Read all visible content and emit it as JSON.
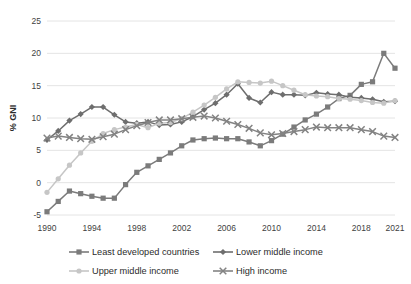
{
  "chart_data": {
    "type": "line",
    "title": "",
    "xlabel": "",
    "ylabel": "% GNI",
    "ylim": [
      -5,
      25
    ],
    "ytick_labels": [
      "-5",
      "0",
      "5",
      "10",
      "15",
      "20",
      "25"
    ],
    "yticks": [
      -5,
      0,
      5,
      10,
      15,
      20,
      25
    ],
    "grid": true,
    "legend_position": "bottom",
    "x": [
      1990,
      1991,
      1992,
      1993,
      1994,
      1995,
      1996,
      1997,
      1998,
      1999,
      2000,
      2001,
      2002,
      2003,
      2004,
      2005,
      2006,
      2007,
      2008,
      2009,
      2010,
      2011,
      2012,
      2013,
      2014,
      2015,
      2016,
      2017,
      2018,
      2019,
      2020,
      2021
    ],
    "xtick_labels": [
      "1990",
      "1994",
      "1998",
      "2002",
      "2006",
      "2010",
      "2014",
      "2018",
      "2021"
    ],
    "xticks": [
      1990,
      1994,
      1998,
      2002,
      2006,
      2010,
      2014,
      2018,
      2021
    ],
    "series": [
      {
        "name": "Least developed countries",
        "color": "#7b7b7b",
        "marker": "square",
        "values": [
          -4.5,
          -2.9,
          -1.3,
          -1.7,
          -2.1,
          -2.4,
          -2.4,
          -0.3,
          1.6,
          2.6,
          3.6,
          4.6,
          5.7,
          6.6,
          6.8,
          6.9,
          6.8,
          6.8,
          6.3,
          5.7,
          6.5,
          7.5,
          8.6,
          9.7,
          10.6,
          11.7,
          13.0,
          13.5,
          15.2,
          15.6,
          20.0,
          17.7
        ]
      },
      {
        "name": "Lower middle income",
        "color": "#6e6e6e",
        "marker": "diamond",
        "values": [
          6.6,
          8.0,
          9.6,
          10.6,
          11.7,
          11.7,
          10.5,
          9.4,
          9.2,
          9.4,
          8.9,
          9.0,
          9.4,
          10.2,
          11.3,
          12.3,
          13.6,
          15.3,
          13.1,
          12.4,
          14.0,
          13.6,
          13.6,
          13.5,
          13.9,
          13.7,
          13.6,
          13.2,
          13.1,
          12.9,
          12.5,
          12.6
        ]
      },
      {
        "name": "Upper middle income",
        "color": "#c6c6c6",
        "marker": "circle",
        "values": [
          -1.5,
          0.6,
          2.7,
          4.6,
          6.4,
          7.6,
          8.2,
          8.6,
          9.0,
          8.5,
          9.2,
          9.3,
          9.9,
          10.9,
          12.0,
          13.2,
          14.5,
          15.6,
          15.5,
          15.4,
          15.7,
          15.0,
          14.3,
          13.6,
          13.4,
          13.3,
          13.0,
          12.9,
          12.7,
          12.4,
          12.3,
          12.7
        ]
      },
      {
        "name": "High income",
        "color": "#838383",
        "marker": "x",
        "values": [
          6.9,
          7.2,
          7.0,
          6.8,
          6.7,
          7.1,
          7.5,
          8.2,
          8.8,
          9.3,
          9.7,
          9.7,
          9.9,
          10.1,
          10.3,
          10.0,
          9.5,
          9.0,
          8.4,
          7.7,
          7.4,
          7.6,
          7.9,
          8.2,
          8.6,
          8.5,
          8.5,
          8.5,
          8.2,
          7.9,
          7.2,
          7.0
        ]
      }
    ]
  },
  "legend": {
    "items": [
      {
        "label": "Least developed countries"
      },
      {
        "label": "Lower middle income"
      },
      {
        "label": "Upper middle income"
      },
      {
        "label": "High income"
      }
    ]
  }
}
